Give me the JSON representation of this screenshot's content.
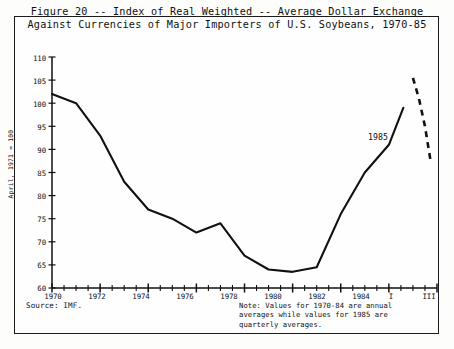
{
  "figure": {
    "title_line1": "Figure 20 -- Index of Real Weighted -- Average Dollar Exchange",
    "title_line2": "Against Currencies of Major Importers of U.S. Soybeans, 1970-85",
    "source": "Source:  IMF.",
    "note_line1": "Note:  Values for 1970-84 are annual",
    "note_line2": "averages while values for 1985 are",
    "note_line3": "quarterly averages.",
    "series_annotation": "1985",
    "line_color": "#111111",
    "frame_color": "#1b1b1b",
    "background": "#fefefe"
  },
  "chart_data": {
    "type": "line",
    "title": "Figure 20 -- Index of Real Weighted -- Average Dollar Exchange Against Currencies of Major Importers of U.S. Soybeans, 1970-85",
    "xlabel": "",
    "ylabel": "April, 1971 = 100",
    "ylim": [
      60,
      110
    ],
    "ytick_labels": [
      "110",
      "105",
      "100",
      "95",
      "90",
      "85",
      "80",
      "75",
      "70",
      "65",
      "60"
    ],
    "ytick_values": [
      110,
      105,
      100,
      95,
      90,
      85,
      80,
      75,
      70,
      65,
      60
    ],
    "xtick_labels": [
      "1970",
      "1972",
      "1974",
      "1976",
      "1978",
      "1980",
      "1982",
      "1984",
      "I",
      "III"
    ],
    "xtick_values": [
      1970,
      1972,
      1974,
      1976,
      1978,
      1980,
      1982,
      1984,
      1985.125,
      1985.625
    ],
    "minor_tick_interval": 1,
    "grid": false,
    "legend": false,
    "series": [
      {
        "name": "Annual averages 1970-84",
        "style": "solid",
        "x": [
          1970,
          1971,
          1972,
          1973,
          1974,
          1975,
          1976,
          1977,
          1978,
          1979,
          1980,
          1981,
          1982,
          1983,
          1984
        ],
        "values": [
          102,
          100,
          93,
          83,
          77,
          75,
          72,
          74,
          67,
          64,
          63.5,
          64.5,
          76,
          85,
          91
        ]
      },
      {
        "name": "1985 quarterly averages",
        "style": "dashed",
        "x": [
          1985.0,
          1985.25,
          1985.5,
          1985.75
        ],
        "values": [
          105.5,
          101,
          95,
          87
        ]
      }
    ],
    "solid_end_value": 99,
    "annotations": [
      {
        "text": "1985",
        "x": 1985.4,
        "y": 93
      }
    ]
  },
  "axes": {
    "y_axis_label": "April, 1971 = 100"
  }
}
